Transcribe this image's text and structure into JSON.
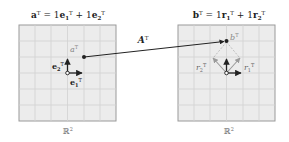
{
  "left_panel": {
    "title": {
      "lhs": "a",
      "sup": "T",
      "eq": " = 1",
      "t1": "e",
      "t1sub": "1",
      "t1sup": "T",
      "plus": " + 1",
      "t2": "e",
      "t2sub": "2",
      "t2sup": "T"
    },
    "space_label": "ℝ",
    "space_sup": "2",
    "point_label": "a",
    "point_sup": "T",
    "vec1_label": "e",
    "vec1_sub": "1",
    "vec1_sup": "T",
    "vec2_label": "e",
    "vec2_sub": "2",
    "vec2_sup": "T"
  },
  "right_panel": {
    "title": {
      "lhs": "b",
      "sup": "T",
      "eq": " = 1",
      "t1": "r",
      "t1sub": "1",
      "t1sup": "T",
      "plus": " + 1",
      "t2": "r",
      "t2sub": "2",
      "t2sup": "T"
    },
    "space_label": "ℝ",
    "space_sup": "2",
    "point_label": "b",
    "point_sup": "T",
    "vec1_label": "r",
    "vec1_sub": "1",
    "vec1_sup": "T",
    "vec2_label": "r",
    "vec2_sub": "2",
    "vec2_sup": "T"
  },
  "mapping": {
    "label": "A",
    "sup": "T"
  },
  "colors": {
    "grid_bg": "#ececec",
    "grid_line": "#d2d2d2",
    "border": "#9a9a9a",
    "ink": "#222222",
    "dashed": "#b0b0b0"
  }
}
